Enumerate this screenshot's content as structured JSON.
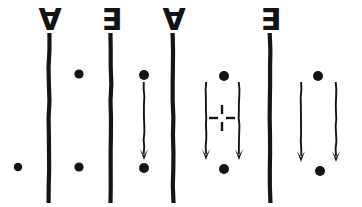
{
  "figure": {
    "background_color": "#ffffff",
    "ink_color": "#151515",
    "width": 362,
    "height": 207
  },
  "columns": [
    {
      "id": "col-0",
      "separator": null,
      "contents": "single dot"
    },
    {
      "id": "col-1",
      "separator": {
        "symbol": "∀",
        "name": "for-all-symbol",
        "reading": "universal quantifier",
        "x": 49,
        "bar_top": 32,
        "bar_bottom": 203
      },
      "contents": "two dots, no arrow"
    },
    {
      "id": "col-2",
      "separator": {
        "symbol": "∃",
        "name": "there-exists-symbol",
        "reading": "existential quantifier",
        "x": 111,
        "bar_top": 32,
        "bar_bottom": 203
      },
      "contents": "single arrow between dots"
    },
    {
      "id": "col-3",
      "separator": {
        "symbol": "∀",
        "name": "for-all-symbol",
        "reading": "universal quantifier",
        "x": 173,
        "bar_top": 32,
        "bar_bottom": 203
      },
      "contents": "double arrow with dashed cross between dots"
    },
    {
      "id": "col-4",
      "separator": {
        "symbol": "∃",
        "name": "there-exists-symbol",
        "reading": "existential quantifier",
        "x": 270,
        "bar_top": 32,
        "bar_bottom": 203
      },
      "contents": "double arrow between dots"
    }
  ],
  "quantifier_glyphs": [
    {
      "label": "∀",
      "x": 50,
      "y": 30,
      "size": 30
    },
    {
      "label": "∃",
      "x": 112,
      "y": 30,
      "size": 30
    },
    {
      "label": "∀",
      "x": 174,
      "y": 30,
      "size": 30
    },
    {
      "label": "∃",
      "x": 271,
      "y": 30,
      "size": 30
    }
  ],
  "separator_bars": [
    {
      "name": "separator-bar-1",
      "x": 49,
      "y1": 33,
      "y2": 203,
      "width": 4.2
    },
    {
      "name": "separator-bar-2",
      "x": 111,
      "y1": 33,
      "y2": 203,
      "width": 4.2
    },
    {
      "name": "separator-bar-3",
      "x": 173,
      "y1": 33,
      "y2": 203,
      "width": 4.2
    },
    {
      "name": "separator-bar-4",
      "x": 270,
      "y1": 33,
      "y2": 203,
      "width": 4.2
    }
  ],
  "dots": [
    {
      "name": "dot-col0-lower",
      "cx": 18,
      "cy": 167,
      "r": 4.2
    },
    {
      "name": "dot-col1-upper",
      "cx": 79,
      "cy": 74,
      "r": 4.6
    },
    {
      "name": "dot-col1-lower",
      "cx": 79,
      "cy": 167,
      "r": 4.6
    },
    {
      "name": "dot-col2-upper",
      "cx": 144,
      "cy": 75,
      "r": 5.0
    },
    {
      "name": "dot-col2-lower",
      "cx": 144,
      "cy": 168,
      "r": 5.0
    },
    {
      "name": "dot-col3-upper",
      "cx": 224,
      "cy": 76,
      "r": 5.0
    },
    {
      "name": "dot-col3-lower",
      "cx": 224,
      "cy": 169,
      "r": 5.0
    },
    {
      "name": "dot-col4-upper",
      "cx": 318,
      "cy": 76,
      "r": 5.0
    },
    {
      "name": "dot-col4-lower",
      "cx": 320,
      "cy": 171,
      "r": 5.0
    }
  ],
  "arrows": [
    {
      "name": "arrow-col2",
      "x1": 144,
      "y1": 82,
      "x2": 144,
      "y2": 160,
      "width": 1.9,
      "head_width": 8,
      "head_length": 11
    },
    {
      "name": "arrow-col3-left",
      "x1": 206,
      "y1": 82,
      "x2": 206,
      "y2": 160,
      "width": 1.9,
      "head_width": 8,
      "head_length": 11
    },
    {
      "name": "arrow-col3-right",
      "x1": 239,
      "y1": 82,
      "x2": 239,
      "y2": 160,
      "width": 1.9,
      "head_width": 8,
      "head_length": 11
    },
    {
      "name": "arrow-col4-left",
      "x1": 301,
      "y1": 82,
      "x2": 301,
      "y2": 162,
      "width": 1.9,
      "head_width": 8,
      "head_length": 11
    },
    {
      "name": "arrow-col4-right",
      "x1": 336,
      "y1": 82,
      "x2": 336,
      "y2": 162,
      "width": 1.9,
      "head_width": 8,
      "head_length": 11
    }
  ],
  "dashed_cross": {
    "name": "dashed-cross-marker",
    "cx": 222,
    "cy": 118,
    "arm_length": 9,
    "gap": 4,
    "width": 2.4,
    "arms": [
      "up",
      "down",
      "left",
      "right"
    ]
  }
}
